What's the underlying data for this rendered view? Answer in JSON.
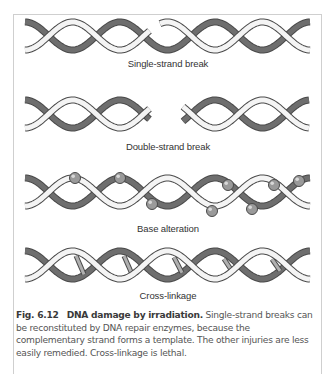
{
  "figure": {
    "number": "Fig. 6.12",
    "title": "DNA damage by irradiation.",
    "caption_body": " Single-strand breaks can be reconstituted by DNA repair enzymes, because the complementary strand forms a template. The other injuries are less easily remedied. Cross-linkage is lethal."
  },
  "panels": [
    {
      "id": "single-strand-break",
      "label": "Single-strand break",
      "top": 16,
      "damage": "single-break"
    },
    {
      "id": "double-strand-break",
      "label": "Double-strand break",
      "top": 94,
      "damage": "double-break"
    },
    {
      "id": "base-alteration",
      "label": "Base alteration",
      "top": 168,
      "damage": "bases"
    },
    {
      "id": "cross-linkage",
      "label": "Cross-linkage",
      "top": 245,
      "damage": "crosslinks"
    }
  ],
  "colors": {
    "frame_border": "#cfcfcf",
    "strand_light": "#f4f4f4",
    "strand_dark": "#6e6e6e",
    "strand_outline": "#4a4a4a",
    "ball": "#9a9a9a",
    "label_text": "#333333",
    "caption_text": "#555555"
  }
}
